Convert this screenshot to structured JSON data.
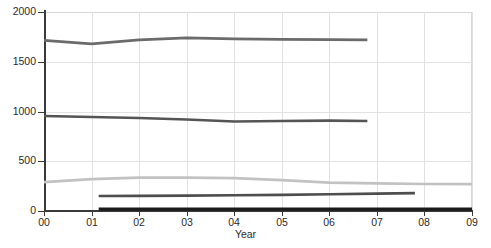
{
  "chart_data": {
    "type": "line",
    "title": "",
    "xlabel": "Year",
    "ylabel": "",
    "xlim": [
      0,
      9
    ],
    "ylim": [
      0,
      2000
    ],
    "xticks": [
      "00",
      "01",
      "02",
      "03",
      "04",
      "05",
      "06",
      "07",
      "08",
      "09"
    ],
    "yticks": [
      "0",
      "500",
      "1000",
      "1500",
      "2000"
    ],
    "grid": true,
    "legend": "none",
    "x": [
      0,
      1,
      2,
      3,
      4,
      5,
      6,
      7,
      8,
      9
    ],
    "series": [
      {
        "name": "series-1",
        "color": "#6b6b6b",
        "x": [
          0,
          1,
          2,
          3,
          4,
          5,
          6,
          6.8
        ],
        "values": [
          1715,
          1680,
          1720,
          1740,
          1730,
          1725,
          1722,
          1720
        ]
      },
      {
        "name": "series-2",
        "color": "#555555",
        "x": [
          0,
          1,
          2,
          3,
          4,
          5,
          6,
          6.8
        ],
        "values": [
          955,
          945,
          935,
          920,
          900,
          905,
          908,
          905
        ]
      },
      {
        "name": "series-3",
        "color": "#c2c2c2",
        "x": [
          0,
          1,
          2,
          3,
          4,
          5,
          6,
          7,
          8,
          9
        ],
        "values": [
          290,
          320,
          335,
          335,
          330,
          310,
          285,
          278,
          272,
          270
        ]
      },
      {
        "name": "series-4",
        "color": "#4e4e4e",
        "x": [
          1.15,
          2,
          3,
          4,
          5,
          6,
          7,
          7.8
        ],
        "values": [
          150,
          152,
          155,
          158,
          162,
          168,
          175,
          180
        ]
      },
      {
        "name": "series-5",
        "color": "#1a1a1a",
        "x": [
          1.15,
          2,
          3,
          4,
          5,
          6,
          7,
          8,
          9
        ],
        "values": [
          18,
          18,
          18,
          18,
          18,
          18,
          18,
          18,
          18
        ]
      }
    ]
  },
  "axis": {
    "x_title": "Year"
  }
}
